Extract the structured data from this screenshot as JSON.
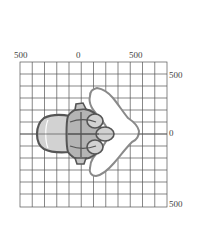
{
  "axes": {
    "top_labels": [
      {
        "text": "500",
        "x": 14,
        "y": 51
      },
      {
        "text": "0",
        "x": 76,
        "y": 51
      },
      {
        "text": "500",
        "x": 129,
        "y": 51
      }
    ],
    "right_labels": [
      {
        "text": "500",
        "x": 169,
        "y": 71
      },
      {
        "text": "0",
        "x": 169,
        "y": 129
      },
      {
        "text": "500",
        "x": 169,
        "y": 200
      }
    ]
  },
  "grid": {
    "x0": 20,
    "y0": 62,
    "x1": 167,
    "y1": 207,
    "cols": 12,
    "rows": 12,
    "color": "#555555"
  },
  "colors": {
    "outer_fill": "#ffffff",
    "outer_stroke": "#8a8a8a",
    "light_fill": "#d2d2d2",
    "mid_fill": "#b4b4b4",
    "dark_stroke": "#555555"
  }
}
